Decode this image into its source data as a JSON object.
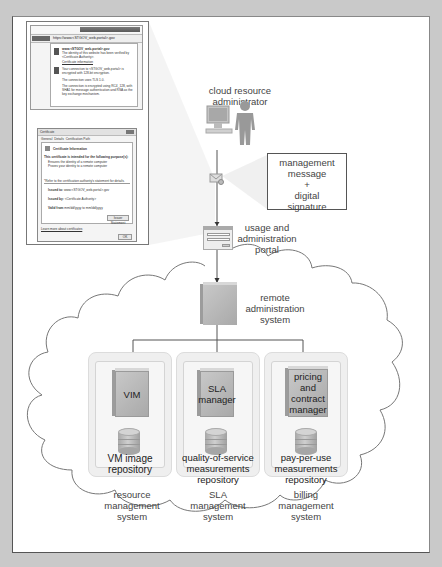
{
  "diagram": {
    "background_color": "#c9c9c9",
    "panel_color": "#ffffff",
    "line_color": "#555555",
    "box_color": "#b4b4b4"
  },
  "inset_screenshot": {
    "browser": {
      "url": "https://www.<STGOV_web-portal>.gov",
      "popup": {
        "site": "www.<STGOV_web-portal>.gov",
        "identity_text": "The identity of this website has been verified by <Certificate Authority>.",
        "cert_link": "Certificate information",
        "encryption_text": "Your connection to <STGOV_web-portal> is encrypted with 128-bit encryption.",
        "tls_text": "The connection uses TLS 1.0.",
        "cipher_text": "The connection is encrypted using RC4_128, with SHA1 for message authentication and RSA as the key exchange mechanism."
      }
    },
    "certificate_dialog": {
      "title": "Certificate",
      "tabs": [
        "General",
        "Details",
        "Certification Path"
      ],
      "heading": "Certificate Information",
      "purpose_text": "This certificate is intended for the following purpose(s):",
      "purposes": [
        "Ensures the identity of a remote computer",
        "Proves your identity to a remote computer"
      ],
      "ca_note": "*Refer to the certification authority's statement for details.",
      "issued_to_label": "Issued to:",
      "issued_to": "www.<STGOV_web-portal>.gov",
      "issued_by_label": "Issued by:",
      "issued_by": "<Certificate Authority>",
      "valid_label": "Valid from",
      "valid_value": "mm/dd/yyyy to mm/dd/yyyy",
      "issuer_button": "Issuer Statement",
      "learn_more": "Learn more about certificates",
      "ok_button": "OK"
    }
  },
  "nodes": {
    "admin": {
      "label": "cloud resource administrator"
    },
    "message": {
      "label_lines": [
        "management",
        "message",
        "+",
        "digital",
        "signature"
      ]
    },
    "portal": {
      "label": "usage and administration portal"
    },
    "remote_admin": {
      "label": "remote administration system"
    },
    "systems": [
      {
        "component": "VIM",
        "repository": "VM image repository",
        "system": "resource management system"
      },
      {
        "component": "SLA manager",
        "repository": "quality-of-service measurements repository",
        "system": "SLA management system"
      },
      {
        "component": "pricing and contract manager",
        "repository": "pay-per-use measurements repository",
        "system": "billing management system"
      }
    ]
  }
}
